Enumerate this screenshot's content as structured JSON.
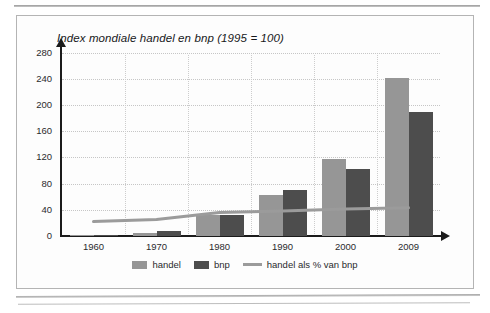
{
  "figure": {
    "title": "Index mondiale handel en bnp (1995 = 100)"
  },
  "legend": {
    "items": [
      {
        "label": "handel",
        "marker": "swatch-light-gray",
        "color": "#969696"
      },
      {
        "label": "bnp",
        "marker": "swatch-dark-gray",
        "color": "#4d4d4d"
      },
      {
        "label": "handel als % van bnp",
        "marker": "line-gray",
        "color": "#9b9b9b"
      }
    ]
  },
  "chart_data": {
    "type": "bar",
    "title": "Index mondiale handel en bnp (1995 = 100)",
    "xlabel": "",
    "ylabel": "",
    "categories": [
      "1960",
      "1970",
      "1980",
      "1990",
      "2000",
      "2009"
    ],
    "series": [
      {
        "name": "handel",
        "type": "bar",
        "color": "#969696",
        "values": [
          2,
          4,
          32,
          63,
          118,
          241
        ]
      },
      {
        "name": "bnp",
        "type": "bar",
        "color": "#4d4d4d",
        "values": [
          2,
          7,
          32,
          70,
          102,
          189
        ]
      },
      {
        "name": "handel als % van bnp",
        "type": "line",
        "color": "#9b9b9b",
        "values": [
          22,
          25,
          36,
          38,
          41,
          43
        ]
      }
    ],
    "ylim": [
      0,
      290
    ],
    "yticks": [
      0,
      40,
      80,
      120,
      160,
      200,
      240,
      280
    ],
    "ytick_labels": [
      "0",
      "40",
      "80",
      "120",
      "160",
      "200",
      "240",
      "280"
    ],
    "xtick_labels": [
      "1960",
      "1970",
      "1980",
      "1990",
      "2000",
      "2009"
    ],
    "grid": true,
    "legend_position": "bottom"
  }
}
